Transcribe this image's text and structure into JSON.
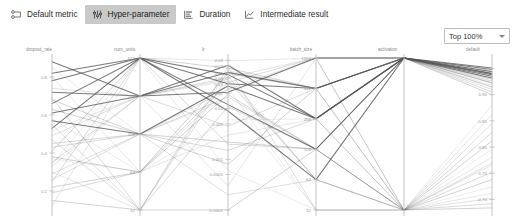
{
  "toolbar": {
    "tabs": [
      {
        "label": "Default metric",
        "icon": "metric-icon",
        "active": false
      },
      {
        "label": "Hyper-parameter",
        "icon": "hyperparameter-icon",
        "active": true
      },
      {
        "label": "Duration",
        "icon": "duration-icon",
        "active": false
      },
      {
        "label": "Intermediate result",
        "icon": "intermediate-result-icon",
        "active": false
      }
    ],
    "active_tab_bg": "#c9c9c9"
  },
  "filter": {
    "selected": "Top 100%",
    "icon": "chevron-down-icon"
  },
  "chart_data": {
    "type": "line",
    "subtype": "parallel-coordinates",
    "title": "",
    "xlabel": "",
    "ylabel": "",
    "grid": false,
    "legend": "none",
    "line_color": "#555555",
    "axes": [
      {
        "name": "dropout_rate",
        "x": 52,
        "scale": "linear",
        "range": [
          0.1,
          0.9
        ],
        "ticks": [
          {
            "label": "0.8",
            "v": 0.8
          },
          {
            "label": "0.6",
            "v": 0.6
          },
          {
            "label": "0.4",
            "v": 0.4
          },
          {
            "label": "0.2",
            "v": 0.2
          }
        ]
      },
      {
        "name": "num_units",
        "x": 140,
        "scale": "log2",
        "range": [
          32,
          512
        ],
        "ticks": [
          {
            "label": "512",
            "v": 512
          },
          {
            "label": "256",
            "v": 256
          },
          {
            "label": "128",
            "v": 128
          },
          {
            "label": "64",
            "v": 64
          },
          {
            "label": "32",
            "v": 32
          }
        ]
      },
      {
        "name": "lr",
        "x": 228,
        "scale": "log",
        "range": [
          0.0001,
          0.1
        ],
        "ticks": [
          {
            "label": "0.09",
            "v": 0.09
          },
          {
            "label": "0.07",
            "v": 0.07
          },
          {
            "label": "0.05",
            "v": 0.05
          },
          {
            "label": "0.04",
            "v": 0.04
          },
          {
            "label": "0.03",
            "v": 0.03
          },
          {
            "label": "0.02",
            "v": 0.02
          },
          {
            "label": "0.01",
            "v": 0.01
          },
          {
            "label": "0.005",
            "v": 0.005
          },
          {
            "label": "0.001",
            "v": 0.001
          },
          {
            "label": "0.0005",
            "v": 0.0005
          },
          {
            "label": "0.0001",
            "v": 0.0001
          }
        ]
      },
      {
        "name": "batch_size",
        "x": 316,
        "scale": "log2",
        "range": [
          32,
          1024
        ],
        "ticks": [
          {
            "label": "1024",
            "v": 1024
          },
          {
            "label": "512",
            "v": 512
          },
          {
            "label": "256",
            "v": 256
          },
          {
            "label": "128",
            "v": 128
          },
          {
            "label": "64",
            "v": 64
          },
          {
            "label": "32",
            "v": 32
          }
        ]
      },
      {
        "name": "activation",
        "x": 404,
        "scale": "categorical",
        "range": [
          0,
          1
        ],
        "ticks": []
      },
      {
        "name": "default",
        "x": 492,
        "scale": "linear",
        "range": [
          0.68,
          0.97
        ],
        "ticks": [
          {
            "label": "0.95",
            "v": 0.95
          },
          {
            "label": "0.90",
            "v": 0.9
          },
          {
            "label": "0.85",
            "v": 0.85
          },
          {
            "label": "0.80",
            "v": 0.8
          },
          {
            "label": "0.75",
            "v": 0.75
          },
          {
            "label": "0.70",
            "v": 0.7
          }
        ]
      }
    ],
    "runs": [
      {
        "dropout_rate": 0.82,
        "num_units": 512,
        "lr": 0.031,
        "batch_size": 512,
        "activation": 1,
        "default": 0.951
      },
      {
        "dropout_rate": 0.78,
        "num_units": 512,
        "lr": 0.047,
        "batch_size": 256,
        "activation": 1,
        "default": 0.948
      },
      {
        "dropout_rate": 0.72,
        "num_units": 256,
        "lr": 0.021,
        "batch_size": 1024,
        "activation": 1,
        "default": 0.944
      },
      {
        "dropout_rate": 0.66,
        "num_units": 512,
        "lr": 0.012,
        "batch_size": 128,
        "activation": 1,
        "default": 0.941
      },
      {
        "dropout_rate": 0.61,
        "num_units": 256,
        "lr": 0.052,
        "batch_size": 512,
        "activation": 1,
        "default": 0.938
      },
      {
        "dropout_rate": 0.57,
        "num_units": 128,
        "lr": 0.028,
        "batch_size": 256,
        "activation": 1,
        "default": 0.935
      },
      {
        "dropout_rate": 0.53,
        "num_units": 512,
        "lr": 0.009,
        "batch_size": 64,
        "activation": 1,
        "default": 0.932
      },
      {
        "dropout_rate": 0.49,
        "num_units": 256,
        "lr": 0.041,
        "batch_size": 1024,
        "activation": 1,
        "default": 0.929
      },
      {
        "dropout_rate": 0.45,
        "num_units": 128,
        "lr": 0.017,
        "batch_size": 128,
        "activation": 1,
        "default": 0.926
      },
      {
        "dropout_rate": 0.41,
        "num_units": 512,
        "lr": 0.063,
        "batch_size": 512,
        "activation": 1,
        "default": 0.922
      },
      {
        "dropout_rate": 0.37,
        "num_units": 64,
        "lr": 0.006,
        "batch_size": 256,
        "activation": 1,
        "default": 0.918
      },
      {
        "dropout_rate": 0.33,
        "num_units": 256,
        "lr": 0.035,
        "batch_size": 64,
        "activation": 1,
        "default": 0.914
      },
      {
        "dropout_rate": 0.29,
        "num_units": 128,
        "lr": 0.024,
        "batch_size": 1024,
        "activation": 1,
        "default": 0.91
      },
      {
        "dropout_rate": 0.25,
        "num_units": 512,
        "lr": 0.002,
        "batch_size": 128,
        "activation": 1,
        "default": 0.905
      },
      {
        "dropout_rate": 0.22,
        "num_units": 64,
        "lr": 0.049,
        "batch_size": 512,
        "activation": 1,
        "default": 0.9
      },
      {
        "dropout_rate": 0.85,
        "num_units": 128,
        "lr": 0.015,
        "batch_size": 32,
        "activation": 0,
        "default": 0.88
      },
      {
        "dropout_rate": 0.8,
        "num_units": 64,
        "lr": 0.003,
        "batch_size": 256,
        "activation": 0,
        "default": 0.862
      },
      {
        "dropout_rate": 0.74,
        "num_units": 256,
        "lr": 0.038,
        "batch_size": 64,
        "activation": 0,
        "default": 0.845
      },
      {
        "dropout_rate": 0.69,
        "num_units": 32,
        "lr": 0.011,
        "batch_size": 128,
        "activation": 0,
        "default": 0.828
      },
      {
        "dropout_rate": 0.63,
        "num_units": 128,
        "lr": 0.0008,
        "batch_size": 512,
        "activation": 0,
        "default": 0.812
      },
      {
        "dropout_rate": 0.58,
        "num_units": 64,
        "lr": 0.026,
        "batch_size": 32,
        "activation": 0,
        "default": 0.796
      },
      {
        "dropout_rate": 0.52,
        "num_units": 256,
        "lr": 0.0003,
        "batch_size": 1024,
        "activation": 0,
        "default": 0.781
      },
      {
        "dropout_rate": 0.47,
        "num_units": 32,
        "lr": 0.044,
        "batch_size": 64,
        "activation": 0,
        "default": 0.766
      },
      {
        "dropout_rate": 0.43,
        "num_units": 128,
        "lr": 0.0015,
        "batch_size": 256,
        "activation": 0,
        "default": 0.752
      },
      {
        "dropout_rate": 0.38,
        "num_units": 64,
        "lr": 0.019,
        "batch_size": 128,
        "activation": 0,
        "default": 0.738
      },
      {
        "dropout_rate": 0.34,
        "num_units": 512,
        "lr": 0.0006,
        "batch_size": 32,
        "activation": 0,
        "default": 0.724
      },
      {
        "dropout_rate": 0.3,
        "num_units": 32,
        "lr": 0.056,
        "batch_size": 512,
        "activation": 0,
        "default": 0.712
      },
      {
        "dropout_rate": 0.26,
        "num_units": 128,
        "lr": 0.0002,
        "batch_size": 64,
        "activation": 0,
        "default": 0.702
      },
      {
        "dropout_rate": 0.19,
        "num_units": 64,
        "lr": 0.033,
        "batch_size": 1024,
        "activation": 0,
        "default": 0.692
      },
      {
        "dropout_rate": 0.15,
        "num_units": 32,
        "lr": 0.0001,
        "batch_size": 128,
        "activation": 0,
        "default": 0.684
      },
      {
        "dropout_rate": 0.88,
        "num_units": 256,
        "lr": 0.072,
        "batch_size": 256,
        "activation": 1,
        "default": 0.94
      },
      {
        "dropout_rate": 0.12,
        "num_units": 512,
        "lr": 0.088,
        "batch_size": 1024,
        "activation": 1,
        "default": 0.93
      },
      {
        "dropout_rate": 0.55,
        "num_units": 32,
        "lr": 0.066,
        "batch_size": 32,
        "activation": 0,
        "default": 0.77
      },
      {
        "dropout_rate": 0.35,
        "num_units": 256,
        "lr": 0.0045,
        "batch_size": 512,
        "activation": 1,
        "default": 0.915
      },
      {
        "dropout_rate": 0.68,
        "num_units": 128,
        "lr": 0.0022,
        "batch_size": 128,
        "activation": 1,
        "default": 0.923
      }
    ]
  }
}
